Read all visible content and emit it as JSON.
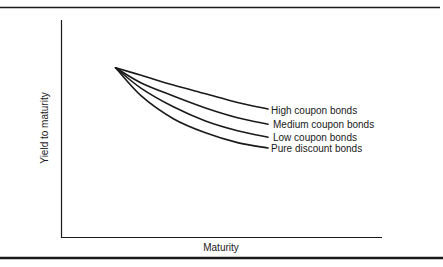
{
  "chart_data": {
    "type": "line",
    "title": "",
    "xlabel": "Maturity",
    "ylabel": "Yield to maturity",
    "xlim": [
      0,
      10
    ],
    "ylim": [
      0,
      10
    ],
    "grid": false,
    "ticks_shown": false,
    "legend": "inline-right",
    "series": [
      {
        "name": "High coupon bonds",
        "x": [
          1.7,
          2.5,
          3.5,
          4.5,
          5.5,
          6.45
        ],
        "y": [
          7.8,
          7.45,
          7.0,
          6.6,
          6.2,
          5.9
        ]
      },
      {
        "name": "Medium coupon bonds",
        "x": [
          1.7,
          2.5,
          3.5,
          4.5,
          5.5,
          6.45
        ],
        "y": [
          7.8,
          7.1,
          6.5,
          5.95,
          5.5,
          5.2
        ]
      },
      {
        "name": "Low coupon bonds",
        "x": [
          1.7,
          2.5,
          3.5,
          4.5,
          5.5,
          6.45
        ],
        "y": [
          7.8,
          6.85,
          6.0,
          5.35,
          4.9,
          4.6
        ]
      },
      {
        "name": "Pure discount bonds",
        "x": [
          1.7,
          2.5,
          3.5,
          4.5,
          5.5,
          6.45
        ],
        "y": [
          7.8,
          6.5,
          5.45,
          4.8,
          4.35,
          4.1
        ]
      }
    ]
  },
  "colors": {
    "ink": "#1a1a1a",
    "background": "#ffffff"
  }
}
